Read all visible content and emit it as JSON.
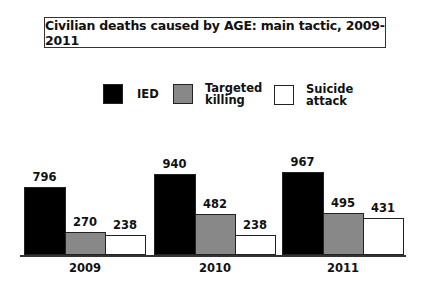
{
  "chart_data": {
    "type": "bar",
    "title": "Civilian deaths caused by AGE: main tactic, 2009-2011",
    "categories": [
      "2009",
      "2010",
      "2011"
    ],
    "series": [
      {
        "name": "IED",
        "color": "#000000",
        "values": [
          796,
          940,
          967
        ]
      },
      {
        "name": "Targeted killing",
        "color": "#888888",
        "values": [
          270,
          482,
          495
        ]
      },
      {
        "name": "Suicide attack",
        "color": "#ffffff",
        "values": [
          238,
          238,
          431
        ]
      }
    ],
    "xlabel": "",
    "ylabel": "",
    "ylim": [
      0,
      1000
    ],
    "grid": false,
    "legend_position": "top",
    "data_labels": true
  },
  "legend": [
    {
      "label": "IED"
    },
    {
      "label": "Targeted\nkilling"
    },
    {
      "label": "Suicide\nattack"
    }
  ]
}
